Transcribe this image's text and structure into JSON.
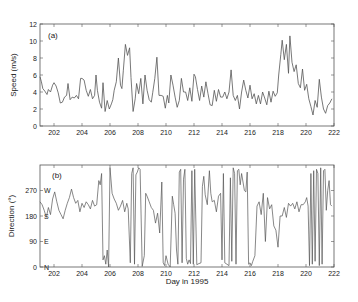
{
  "chart_data": [
    {
      "type": "line",
      "panel_label": "(a)",
      "title": "",
      "xlabel": "",
      "ylabel": "Speed (m/s)",
      "xlim": [
        201,
        222
      ],
      "ylim": [
        0,
        12
      ],
      "xticks": [
        202,
        204,
        206,
        208,
        210,
        212,
        214,
        216,
        218,
        220,
        222
      ],
      "yticks": [
        0,
        2,
        4,
        6,
        8,
        10,
        12
      ],
      "grid": false,
      "legend": null,
      "series": [
        {
          "name": "Wind speed",
          "x": [
            201.0,
            201.1,
            201.2,
            201.35,
            201.5,
            201.6,
            201.75,
            201.9,
            202.0,
            202.15,
            202.3,
            202.45,
            202.6,
            202.75,
            202.9,
            203.0,
            203.15,
            203.3,
            203.45,
            203.6,
            203.75,
            203.9,
            204.0,
            204.15,
            204.3,
            204.45,
            204.6,
            204.75,
            204.9,
            205.0,
            205.1,
            205.25,
            205.4,
            205.5,
            205.65,
            205.8,
            205.95,
            206.1,
            206.2,
            206.3,
            206.45,
            206.6,
            206.75,
            206.85,
            206.95,
            207.1,
            207.25,
            207.4,
            207.5,
            207.65,
            207.8,
            207.9,
            208.05,
            208.2,
            208.35,
            208.5,
            208.65,
            208.8,
            208.95,
            209.05,
            209.2,
            209.35,
            209.5,
            209.65,
            209.8,
            209.95,
            210.1,
            210.2,
            210.35,
            210.5,
            210.65,
            210.8,
            210.95,
            211.1,
            211.25,
            211.4,
            211.55,
            211.7,
            211.85,
            212.0,
            212.1,
            212.25,
            212.4,
            212.55,
            212.7,
            212.85,
            213.0,
            213.15,
            213.3,
            213.45,
            213.6,
            213.75,
            213.9,
            214.05,
            214.2,
            214.35,
            214.5,
            214.65,
            214.8,
            214.95,
            215.1,
            215.25,
            215.4,
            215.55,
            215.7,
            215.85,
            216.0,
            216.15,
            216.3,
            216.45,
            216.6,
            216.75,
            216.9,
            217.05,
            217.2,
            217.35,
            217.5,
            217.65,
            217.8,
            217.95,
            218.05,
            218.2,
            218.3,
            218.45,
            218.6,
            218.75,
            218.85,
            219.0,
            219.15,
            219.3,
            219.45,
            219.6,
            219.75,
            219.9,
            220.05,
            220.2,
            220.35,
            220.5,
            220.65,
            220.8,
            220.95,
            221.1,
            221.25,
            221.4,
            221.55,
            221.7,
            221.85,
            222.0
          ],
          "values": [
            5.8,
            5.2,
            4.4,
            4.1,
            3.7,
            4.3,
            4.0,
            4.8,
            5.1,
            4.7,
            3.9,
            2.7,
            2.8,
            3.4,
            3.6,
            5.0,
            3.1,
            3.4,
            3.3,
            3.6,
            3.2,
            5.6,
            5.6,
            5.4,
            4.2,
            3.5,
            4.3,
            3.2,
            3.6,
            6.0,
            4.2,
            2.8,
            2.1,
            5.1,
            1.7,
            3.0,
            2.0,
            2.6,
            3.1,
            4.2,
            5.2,
            8.0,
            4.8,
            4.4,
            6.5,
            9.6,
            8.3,
            9.2,
            5.7,
            1.7,
            3.2,
            5.0,
            3.8,
            5.6,
            2.6,
            6.0,
            4.2,
            3.1,
            2.8,
            3.9,
            5.6,
            8.1,
            3.6,
            3.6,
            3.5,
            2.1,
            3.6,
            2.7,
            6.0,
            4.8,
            3.4,
            2.2,
            3.0,
            5.6,
            4.0,
            4.0,
            3.0,
            4.5,
            2.9,
            6.1,
            5.8,
            4.3,
            3.0,
            4.7,
            3.4,
            5.2,
            3.8,
            2.5,
            2.4,
            4.2,
            2.9,
            4.3,
            3.4,
            3.4,
            4.0,
            3.2,
            4.0,
            6.6,
            3.6,
            3.0,
            3.6,
            2.0,
            4.0,
            5.4,
            4.2,
            3.3,
            4.8,
            3.2,
            3.8,
            2.6,
            3.6,
            2.6,
            4.0,
            3.3,
            2.5,
            4.1,
            2.8,
            4.1,
            3.5,
            3.9,
            6.0,
            8.4,
            10.1,
            7.8,
            9.6,
            6.2,
            10.6,
            7.5,
            6.4,
            7.2,
            5.0,
            4.5,
            6.7,
            4.2,
            4.9,
            3.2,
            2.3,
            1.3,
            3.0,
            2.2,
            5.5,
            3.4,
            2.0,
            1.5,
            2.4,
            2.7,
            3.2
          ]
        }
      ]
    },
    {
      "type": "line",
      "panel_label": "(b)",
      "title": "",
      "xlabel": "Day in 1995",
      "ylabel": "Direction (°)",
      "xlim": [
        201,
        222
      ],
      "ylim": [
        0,
        360
      ],
      "xticks": [
        202,
        204,
        206,
        208,
        210,
        212,
        214,
        216,
        218,
        220,
        222
      ],
      "yticks": [
        0,
        90,
        180,
        270
      ],
      "ytick_compass": [
        "N",
        "E",
        "S",
        "W"
      ],
      "grid": false,
      "legend": null,
      "series": [
        {
          "name": "Wind direction",
          "x": [
            201.0,
            201.15,
            201.3,
            201.45,
            201.6,
            201.75,
            201.9,
            202.05,
            202.2,
            202.35,
            202.5,
            202.65,
            202.8,
            202.95,
            203.1,
            203.25,
            203.4,
            203.55,
            203.7,
            203.85,
            204.0,
            204.15,
            204.3,
            204.45,
            204.6,
            204.75,
            204.9,
            205.05,
            205.2,
            205.3,
            205.4,
            205.5,
            205.6,
            205.7,
            205.8,
            205.9,
            206.0,
            206.15,
            206.3,
            206.45,
            206.6,
            206.75,
            206.9,
            207.05,
            207.2,
            207.3,
            207.45,
            207.55,
            207.65,
            207.75,
            207.85,
            207.95,
            208.05,
            208.15,
            208.3,
            208.45,
            208.55,
            208.65,
            208.8,
            208.95,
            209.1,
            209.25,
            209.4,
            209.55,
            209.7,
            209.8,
            209.9,
            210.0,
            210.15,
            210.3,
            210.45,
            210.55,
            210.65,
            210.75,
            210.85,
            210.95,
            211.05,
            211.15,
            211.25,
            211.35,
            211.45,
            211.55,
            211.65,
            211.75,
            211.85,
            211.95,
            212.05,
            212.2,
            212.35,
            212.5,
            212.6,
            212.7,
            212.8,
            212.95,
            213.1,
            213.2,
            213.3,
            213.45,
            213.6,
            213.75,
            213.9,
            214.0,
            214.1,
            214.2,
            214.35,
            214.5,
            214.6,
            214.7,
            214.8,
            214.9,
            215.0,
            215.1,
            215.2,
            215.3,
            215.4,
            215.5,
            215.6,
            215.7,
            215.8,
            215.9,
            216.0,
            216.1,
            216.2,
            216.35,
            216.5,
            216.65,
            216.8,
            216.95,
            217.1,
            217.25,
            217.4,
            217.55,
            217.7,
            217.85,
            218.0,
            218.15,
            218.3,
            218.45,
            218.6,
            218.75,
            218.9,
            219.05,
            219.2,
            219.35,
            219.5,
            219.65,
            219.8,
            219.95,
            220.05,
            220.15,
            220.25,
            220.35,
            220.45,
            220.55,
            220.65,
            220.75,
            220.85,
            220.95,
            221.05,
            221.15,
            221.25,
            221.35,
            221.45,
            221.55,
            221.65,
            221.75,
            221.85,
            222.0
          ],
          "values": [
            230,
            220,
            200,
            175,
            210,
            185,
            240,
            265,
            230,
            200,
            185,
            170,
            200,
            225,
            245,
            275,
            245,
            225,
            235,
            195,
            225,
            210,
            230,
            220,
            205,
            235,
            215,
            220,
            305,
            290,
            330,
            25,
            40,
            10,
            60,
            0,
            350,
            260,
            240,
            225,
            200,
            215,
            235,
            195,
            225,
            205,
            15,
            330,
            350,
            10,
            325,
            335,
            350,
            345,
            2,
            40,
            260,
            250,
            230,
            210,
            200,
            155,
            190,
            120,
            300,
            15,
            5,
            40,
            10,
            0,
            250,
            220,
            190,
            60,
            10,
            335,
            345,
            15,
            310,
            345,
            30,
            10,
            25,
            12,
            340,
            10,
            345,
            8,
            12,
            15,
            285,
            320,
            255,
            220,
            340,
            260,
            230,
            235,
            195,
            250,
            260,
            25,
            330,
            15,
            10,
            5,
            315,
            20,
            350,
            330,
            10,
            340,
            345,
            290,
            330,
            300,
            270,
            265,
            335,
            10,
            15,
            5,
            20,
            40,
            215,
            230,
            185,
            260,
            90,
            245,
            205,
            220,
            145,
            130,
            70,
            180,
            180,
            210,
            175,
            225,
            215,
            225,
            205,
            230,
            195,
            220,
            220,
            230,
            245,
            215,
            5,
            330,
            10,
            340,
            20,
            345,
            330,
            5,
            350,
            10,
            340,
            345,
            200,
            270,
            305,
            220,
            215
          ]
        }
      ]
    }
  ]
}
